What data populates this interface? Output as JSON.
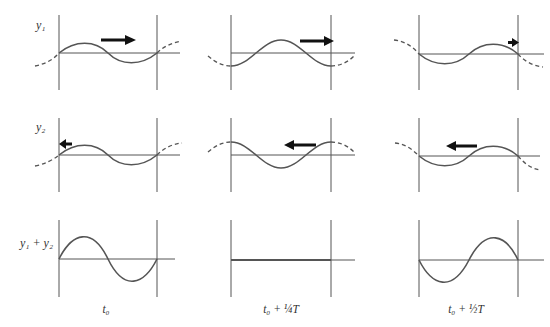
{
  "figure": {
    "row_labels": [
      "y₁",
      "y₂",
      "y₁ + y₂"
    ],
    "column_labels": [
      "t₀",
      "t₀ + ¼T",
      "t₀ + ½T"
    ],
    "colors": {
      "line": "#555555",
      "arrow": "#111111",
      "background": "#ffffff"
    }
  }
}
